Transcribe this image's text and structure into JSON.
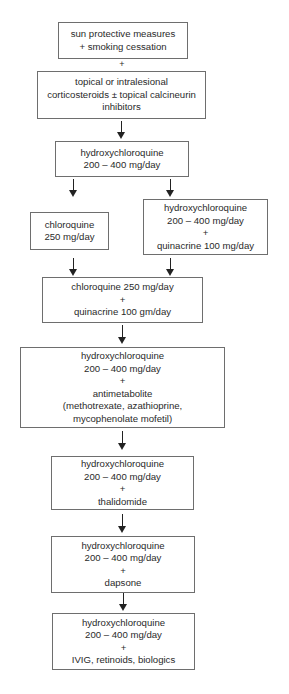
{
  "diagram": {
    "type": "treatment-escalation-flowchart",
    "colors": {
      "border": "#6e6e6e",
      "text": "#2a2a2a",
      "arrow": "#222222",
      "background": "#ffffff"
    },
    "nodes": [
      {
        "id": "n1",
        "lines": [
          "sun protective measures",
          "+ smoking cessation"
        ]
      },
      {
        "id": "plus1",
        "text": "+"
      },
      {
        "id": "n2",
        "lines": [
          "topical or intralesional",
          "corticosteroids ± topical calcineurin",
          "inhibitors"
        ]
      },
      {
        "id": "n3",
        "lines": [
          "hydroxychloroquine",
          "200 – 400 mg/day"
        ]
      },
      {
        "id": "n4",
        "lines": [
          "chloroquine",
          "250 mg/day"
        ]
      },
      {
        "id": "n5",
        "lines": [
          "hydroxychloroquine",
          "200 – 400 mg/day",
          "+",
          "quinacrine 100 mg/day"
        ]
      },
      {
        "id": "n6",
        "lines": [
          "chloroquine 250 mg/day",
          "+",
          "quinacrine 100 gm/day"
        ]
      },
      {
        "id": "n7",
        "lines": [
          "hydroxychloroquine",
          "200 – 400 mg/day",
          "+",
          "antimetabolite",
          "(methotrexate, azathioprine,",
          "mycophenolate mofetil)"
        ]
      },
      {
        "id": "n8",
        "lines": [
          "hydroxychloroquine",
          "200 – 400 mg/day",
          "+",
          "thalidomide"
        ]
      },
      {
        "id": "n9",
        "lines": [
          "hydroxychloroquine",
          "200 – 400 mg/day",
          "+",
          "dapsone"
        ]
      },
      {
        "id": "n10",
        "lines": [
          "hydroxychloroquine",
          "200 – 400 mg/day",
          "+",
          "IVIG, retinoids, biologics"
        ]
      }
    ],
    "edges": [
      {
        "from": "n2",
        "to": "n3"
      },
      {
        "from": "n3",
        "to": "n4"
      },
      {
        "from": "n3",
        "to": "n5"
      },
      {
        "from": "n4",
        "to": "n6"
      },
      {
        "from": "n5",
        "to": "n6"
      },
      {
        "from": "n6",
        "to": "n7"
      },
      {
        "from": "n7",
        "to": "n8"
      },
      {
        "from": "n8",
        "to": "n9"
      },
      {
        "from": "n9",
        "to": "n10"
      }
    ]
  }
}
